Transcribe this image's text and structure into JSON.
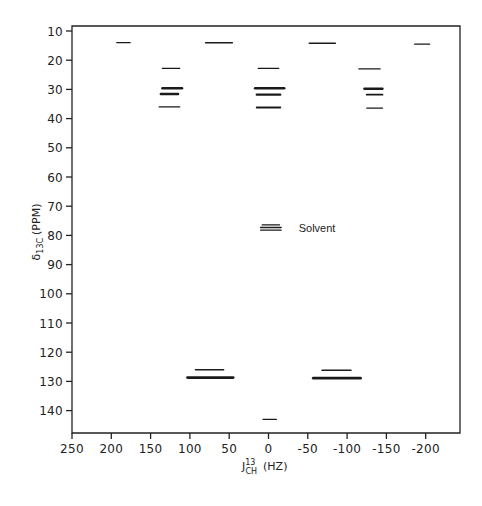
{
  "chart_data": {
    "type": "scatter",
    "subtype": "2D J-resolved NMR contour plot",
    "title": "",
    "xlabel": "J(13)CH (HZ)",
    "xlabel_parts": {
      "main": "J",
      "sup": "13",
      "sub": "CH",
      "unit": "(HZ)"
    },
    "ylabel": "δ13C (PPM)",
    "ylabel_parts": {
      "main": "δ",
      "sub": "13C",
      "unit": "(PPM)"
    },
    "xlim": [
      250,
      -240
    ],
    "ylim": [
      8,
      148
    ],
    "x_inverted": true,
    "y_inverted": true,
    "grid": false,
    "x_ticks": [
      250,
      200,
      150,
      100,
      50,
      0,
      -50,
      -100,
      -150,
      -200
    ],
    "x_tick_labels": [
      "250",
      "200",
      "150",
      "100",
      "50",
      "0",
      "-50",
      "-100",
      "-150",
      "-200"
    ],
    "y_ticks": [
      10,
      20,
      30,
      40,
      50,
      60,
      70,
      80,
      90,
      100,
      110,
      120,
      130,
      140
    ],
    "y_tick_labels": [
      "10",
      "20",
      "30",
      "40",
      "50",
      "60",
      "70",
      "80",
      "90",
      "100",
      "110",
      "120",
      "130",
      "140"
    ],
    "annotations": [
      {
        "text": "Solvent",
        "x": -55,
        "y": 77.5
      }
    ],
    "segments": [
      {
        "y": 14.0,
        "x_from": 193,
        "x_to": 176,
        "w": 1.3
      },
      {
        "y": 14.0,
        "x_from": 80,
        "x_to": 46,
        "w": 1.6
      },
      {
        "y": 14.2,
        "x_from": -52,
        "x_to": -85,
        "w": 1.6
      },
      {
        "y": 14.5,
        "x_from": -186,
        "x_to": -205,
        "w": 1.3
      },
      {
        "y": 22.8,
        "x_from": 135,
        "x_to": 113,
        "w": 1.3
      },
      {
        "y": 22.8,
        "x_from": 13,
        "x_to": -13,
        "w": 1.3
      },
      {
        "y": 23.0,
        "x_from": -115,
        "x_to": -142,
        "w": 1.3
      },
      {
        "y": 29.6,
        "x_from": 135,
        "x_to": 110,
        "w": 2.4
      },
      {
        "y": 31.6,
        "x_from": 137,
        "x_to": 115,
        "w": 2.4
      },
      {
        "y": 36.0,
        "x_from": 139,
        "x_to": 113,
        "w": 1.4
      },
      {
        "y": 29.6,
        "x_from": 17,
        "x_to": -20,
        "w": 2.6
      },
      {
        "y": 31.8,
        "x_from": 15,
        "x_to": -15,
        "w": 2.2
      },
      {
        "y": 36.2,
        "x_from": 15,
        "x_to": -15,
        "w": 1.8
      },
      {
        "y": 29.8,
        "x_from": -122,
        "x_to": -145,
        "w": 2.4
      },
      {
        "y": 31.8,
        "x_from": -125,
        "x_to": -145,
        "w": 1.8
      },
      {
        "y": 36.4,
        "x_from": -125,
        "x_to": -145,
        "w": 1.4
      },
      {
        "y": 76.4,
        "x_from": 8,
        "x_to": -14,
        "w": 1.3
      },
      {
        "y": 77.3,
        "x_from": 10,
        "x_to": -16,
        "w": 1.6
      },
      {
        "y": 78.2,
        "x_from": 10,
        "x_to": -16,
        "w": 1.3
      },
      {
        "y": 126.0,
        "x_from": 93,
        "x_to": 57,
        "w": 1.4
      },
      {
        "y": 128.7,
        "x_from": 103,
        "x_to": 45,
        "w": 2.8
      },
      {
        "y": 126.2,
        "x_from": -68,
        "x_to": -105,
        "w": 1.4
      },
      {
        "y": 128.9,
        "x_from": -57,
        "x_to": -117,
        "w": 2.8
      },
      {
        "y": 143.0,
        "x_from": 7,
        "x_to": -10,
        "w": 1.3
      }
    ]
  },
  "labels": {
    "solvent": "Solvent",
    "x_axis_title_main": "J",
    "x_axis_title_sup": "13",
    "x_axis_title_sub": "CH",
    "x_axis_title_unit": "(HZ)",
    "y_axis_title_main": "δ",
    "y_axis_title_sub": "13C",
    "y_axis_title_unit": "(PPM)"
  }
}
